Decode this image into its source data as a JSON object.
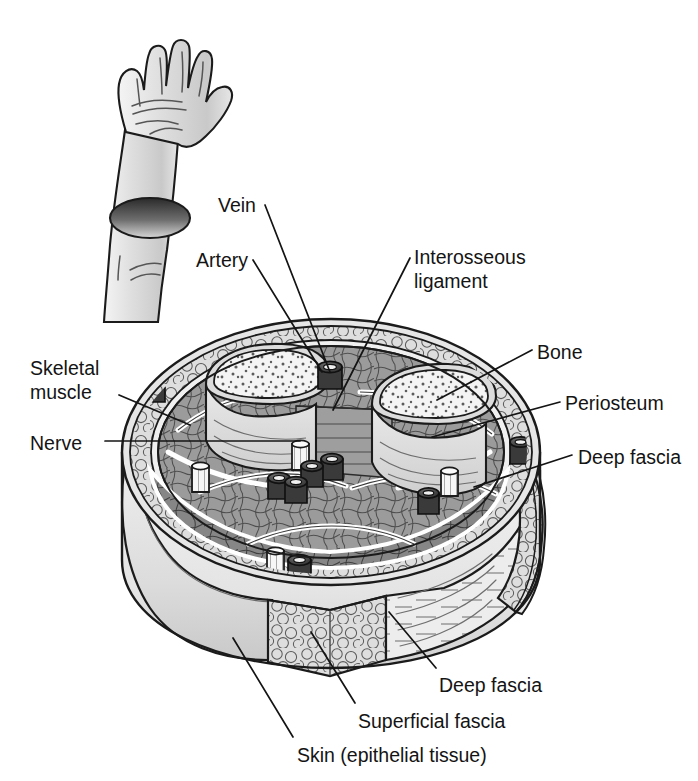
{
  "figure": {
    "background_color": "#ffffff",
    "ink_color": "#141414"
  },
  "inset": {
    "name": "arm-and-hand-illustration",
    "description": "Raised forearm and open hand with the forearm cut transversely",
    "fill_color": "#d9d9d9",
    "cut_surface_color": "#4a4a4a"
  },
  "labels": [
    {
      "id": "vein",
      "text": "Vein",
      "x": 218,
      "y": 194,
      "align": "left"
    },
    {
      "id": "artery",
      "text": "Artery",
      "x": 196,
      "y": 249,
      "align": "left"
    },
    {
      "id": "interosseous",
      "text": "Interosseous\nligament",
      "x": 414,
      "y": 246,
      "align": "left"
    },
    {
      "id": "bone",
      "text": "Bone",
      "x": 537,
      "y": 341,
      "align": "left"
    },
    {
      "id": "skeletal-muscle",
      "text": "Skeletal\nmuscle",
      "x": 30,
      "y": 357,
      "align": "left"
    },
    {
      "id": "periosteum",
      "text": "Periosteum",
      "x": 565,
      "y": 392,
      "align": "left"
    },
    {
      "id": "nerve",
      "text": "Nerve",
      "x": 30,
      "y": 432,
      "align": "left"
    },
    {
      "id": "deep-fascia-right",
      "text": "Deep fascia",
      "x": 578,
      "y": 446,
      "align": "left"
    },
    {
      "id": "deep-fascia-bottom",
      "text": "Deep fascia",
      "x": 439,
      "y": 674,
      "align": "left"
    },
    {
      "id": "superficial-fascia",
      "text": "Superficial fascia",
      "x": 358,
      "y": 710,
      "align": "left"
    },
    {
      "id": "skin",
      "text": "Skin (epithelial tissue)",
      "x": 297,
      "y": 744,
      "align": "left"
    }
  ],
  "leader_lines": [
    {
      "id": "leader-vein",
      "from": [
        265,
        205
      ],
      "to": [
        330,
        372
      ]
    },
    {
      "id": "leader-artery",
      "from": [
        253,
        260
      ],
      "to": [
        322,
        372
      ]
    },
    {
      "id": "leader-interosseous",
      "from": [
        410,
        258
      ],
      "to": [
        333,
        410
      ]
    },
    {
      "id": "leader-bone",
      "from": [
        532,
        350
      ],
      "to": [
        437,
        400
      ]
    },
    {
      "id": "leader-skeletal-muscle",
      "from": [
        119,
        395
      ],
      "to": [
        190,
        425
      ]
    },
    {
      "id": "leader-periosteum",
      "from": [
        560,
        402
      ],
      "to": [
        432,
        437
      ]
    },
    {
      "id": "leader-nerve",
      "from": [
        105,
        441
      ],
      "to": [
        300,
        441
      ]
    },
    {
      "id": "leader-deep-fascia-right",
      "from": [
        572,
        455
      ],
      "to": [
        474,
        487
      ]
    },
    {
      "id": "leader-deep-fascia-bottom",
      "from": [
        436,
        668
      ],
      "to": [
        389,
        612
      ]
    },
    {
      "id": "leader-superficial-fascia",
      "from": [
        355,
        703
      ],
      "to": [
        311,
        632
      ]
    },
    {
      "id": "leader-skin",
      "from": [
        293,
        737
      ],
      "to": [
        233,
        638
      ]
    }
  ],
  "anatomy": {
    "structures": [
      {
        "id": "skin",
        "label": "Skin (epithelial tissue)",
        "tone": "#e2e2e2"
      },
      {
        "id": "superficial-fascia",
        "label": "Superficial fascia",
        "tone": "#dcdcdc"
      },
      {
        "id": "deep-fascia",
        "label": "Deep fascia",
        "tone": "#ececec"
      },
      {
        "id": "skeletal-muscle",
        "label": "Skeletal muscle",
        "tone": "#9a9a9a"
      },
      {
        "id": "bone",
        "label": "Bone",
        "tone": "#efefef"
      },
      {
        "id": "periosteum",
        "label": "Periosteum",
        "tone": "#cfcfcf"
      },
      {
        "id": "interosseous-ligament",
        "label": "Interosseous ligament",
        "tone": "#a8a8a8"
      },
      {
        "id": "artery",
        "label": "Artery",
        "tone": "#3c3c3c"
      },
      {
        "id": "vein",
        "label": "Vein",
        "tone": "#474747"
      },
      {
        "id": "nerve",
        "label": "Nerve",
        "tone": "#f2f2f2"
      }
    ],
    "bones": [
      {
        "id": "bone-radius",
        "cx": 258,
        "cy": 378,
        "label": "Bone"
      },
      {
        "id": "bone-ulna",
        "cx": 420,
        "cy": 398,
        "label": "Bone"
      }
    ],
    "vessels": [
      {
        "id": "vessel-1",
        "cx": 152,
        "cy": 385,
        "kind": "vein"
      },
      {
        "id": "vessel-2",
        "cx": 330,
        "cy": 372,
        "kind": "vein"
      },
      {
        "id": "vessel-3",
        "cx": 332,
        "cy": 463,
        "kind": "artery"
      },
      {
        "id": "vessel-4",
        "cx": 312,
        "cy": 470,
        "kind": "vein"
      },
      {
        "id": "vessel-5",
        "cx": 279,
        "cy": 482,
        "kind": "artery"
      },
      {
        "id": "vessel-6",
        "cx": 296,
        "cy": 486,
        "kind": "vein"
      },
      {
        "id": "vessel-7",
        "cx": 520,
        "cy": 448,
        "kind": "vein"
      },
      {
        "id": "vessel-8",
        "cx": 428,
        "cy": 497,
        "kind": "artery"
      },
      {
        "id": "vessel-9",
        "cx": 299,
        "cy": 566,
        "kind": "vein"
      }
    ],
    "nerves": [
      {
        "id": "nerve-1",
        "cx": 300,
        "cy": 455
      },
      {
        "id": "nerve-2",
        "cx": 200,
        "cy": 477
      },
      {
        "id": "nerve-3",
        "cx": 449,
        "cy": 482
      },
      {
        "id": "nerve-4",
        "cx": 275,
        "cy": 562
      }
    ]
  }
}
